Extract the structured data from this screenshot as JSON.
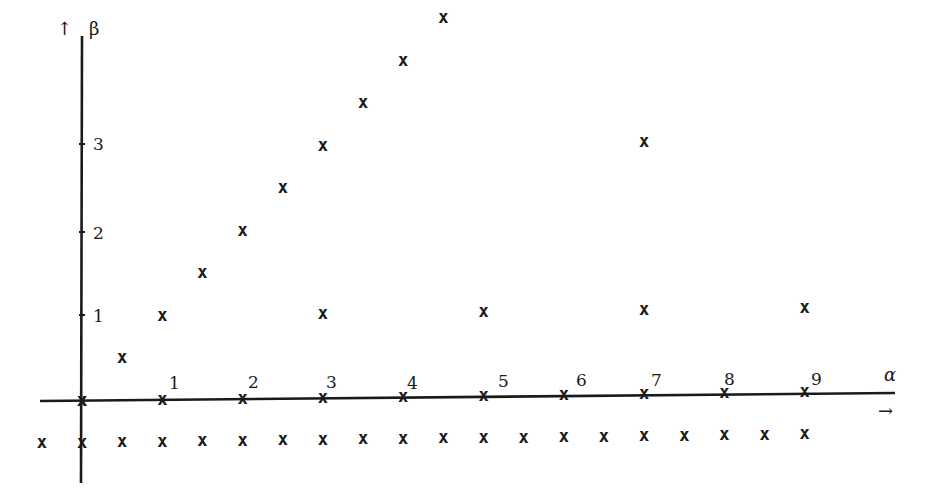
{
  "diagram": {
    "title": "",
    "axis_labels": {
      "horizontal": "α",
      "vertical": "β"
    },
    "horizontal_ticks": [
      "1",
      "2",
      "3",
      "4",
      "5",
      "6",
      "7",
      "8",
      "9"
    ],
    "vertical_ticks": [
      "1",
      "2",
      "3"
    ],
    "marker_symbol": "x",
    "arrow_up_icon": "↑",
    "arrow_right_icon": "→",
    "colors": {
      "ink": "#1a1a1a",
      "background": "#ffffff"
    }
  },
  "chart_data": {
    "type": "scatter",
    "title": "",
    "xlabel": "α",
    "ylabel": "β",
    "x_ticks": [
      1,
      2,
      3,
      4,
      5,
      6,
      7,
      8,
      9
    ],
    "y_ticks": [
      1,
      2,
      3
    ],
    "grid": false,
    "marker": "x",
    "series": [
      {
        "name": "diagonal β = α",
        "points": [
          [
            0,
            0
          ],
          [
            0.5,
            0.5
          ],
          [
            1,
            1
          ],
          [
            1.5,
            1.5
          ],
          [
            2,
            2
          ],
          [
            2.5,
            2.5
          ],
          [
            3,
            3
          ],
          [
            3.5,
            3.5
          ],
          [
            4,
            4
          ],
          [
            4.5,
            4.5
          ]
        ]
      },
      {
        "name": "on α-axis (β = 0)",
        "points": [
          [
            0,
            0
          ],
          [
            1,
            0
          ],
          [
            2,
            0
          ],
          [
            3,
            0
          ],
          [
            4,
            0
          ],
          [
            5,
            0
          ],
          [
            6,
            0
          ],
          [
            7,
            0
          ],
          [
            8,
            0
          ],
          [
            9,
            0
          ]
        ]
      },
      {
        "name": "β = 1 at odd α",
        "points": [
          [
            3,
            1
          ],
          [
            5,
            1
          ],
          [
            7,
            1
          ],
          [
            9,
            1
          ]
        ]
      },
      {
        "name": "β = 3",
        "points": [
          [
            7,
            3
          ]
        ]
      },
      {
        "name": "below axis (β = -0.5)",
        "points": [
          [
            -0.5,
            -0.5
          ],
          [
            0,
            -0.5
          ],
          [
            0.5,
            -0.5
          ],
          [
            1,
            -0.5
          ],
          [
            1.5,
            -0.5
          ],
          [
            2,
            -0.5
          ],
          [
            2.5,
            -0.5
          ],
          [
            3,
            -0.5
          ],
          [
            3.5,
            -0.5
          ],
          [
            4,
            -0.5
          ],
          [
            4.5,
            -0.5
          ],
          [
            5,
            -0.5
          ],
          [
            5.5,
            -0.5
          ],
          [
            6,
            -0.5
          ],
          [
            6.5,
            -0.5
          ],
          [
            7,
            -0.5
          ],
          [
            7.5,
            -0.5
          ],
          [
            8,
            -0.5
          ],
          [
            8.5,
            -0.5
          ],
          [
            9,
            -0.5
          ]
        ]
      }
    ],
    "xlim": [
      -0.5,
      10
    ],
    "ylim": [
      -0.6,
      4.6
    ]
  }
}
